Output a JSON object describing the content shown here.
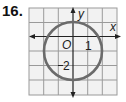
{
  "problem": {
    "number": "16."
  },
  "graph": {
    "axis_labels": {
      "x": "x",
      "y": "y"
    },
    "origin_label": "O",
    "tick_labels": {
      "x_one": "1",
      "y_neg_two": "2"
    },
    "grid": {
      "columns": 6,
      "rows": 6,
      "x_range": [
        -3,
        3
      ],
      "y_range": [
        -4,
        2
      ]
    },
    "circle": {
      "center": [
        0,
        -1
      ],
      "radius": 2,
      "color": "#6b6b6b"
    },
    "colors": {
      "grid_line": "#9a9a9a",
      "grid_fill": "#f2f2f2",
      "axis": "#222222",
      "text": "#222222"
    }
  }
}
